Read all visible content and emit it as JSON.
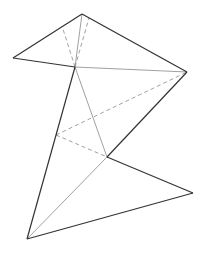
{
  "diagram": {
    "width": 204,
    "height": 253,
    "colors": {
      "solid": "#333333",
      "thin": "#777777",
      "dashed": "#888888",
      "background": "#ffffff"
    },
    "points": {
      "A": [
        82,
        14
      ],
      "B": [
        13,
        58
      ],
      "C": [
        75,
        67
      ],
      "D": [
        187,
        72
      ],
      "E": [
        107,
        157
      ],
      "F": [
        193,
        193
      ],
      "G": [
        27,
        239
      ],
      "H": [
        56,
        135
      ],
      "P1": [
        62,
        26
      ],
      "P2": [
        89,
        18
      ]
    },
    "solid_edges": [
      [
        "A",
        "B"
      ],
      [
        "B",
        "C"
      ],
      [
        "A",
        "D"
      ],
      [
        "C",
        "G"
      ],
      [
        "D",
        "E"
      ],
      [
        "E",
        "F"
      ],
      [
        "F",
        "G"
      ]
    ],
    "thin_edges": [
      [
        "A",
        "C"
      ],
      [
        "C",
        "D"
      ],
      [
        "C",
        "E"
      ],
      [
        "E",
        "G"
      ]
    ],
    "dashed_edges": [
      [
        "C",
        "P1"
      ],
      [
        "C",
        "P2"
      ],
      [
        "H",
        "D"
      ],
      [
        "H",
        "E"
      ]
    ]
  }
}
